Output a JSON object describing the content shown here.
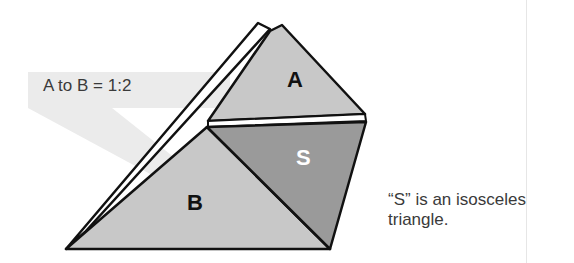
{
  "diagram": {
    "ratio_label": "A to B = 1:2",
    "note_line1": "“S” is an isosceles",
    "note_line2": "triangle.",
    "triangles": [
      {
        "id": "A",
        "label": "A",
        "fill": "#c8c8c8",
        "label_color": "#111111"
      },
      {
        "id": "B",
        "label": "B",
        "fill": "#c8c8c8",
        "label_color": "#111111"
      },
      {
        "id": "S",
        "label": "S",
        "fill": "#9a9a9a",
        "label_color": "#ffffff"
      }
    ],
    "colors": {
      "callout_band": "#ebebeb",
      "outline": "#111111",
      "text": "#3a3a3a",
      "divider": "#e6e6e6"
    }
  }
}
